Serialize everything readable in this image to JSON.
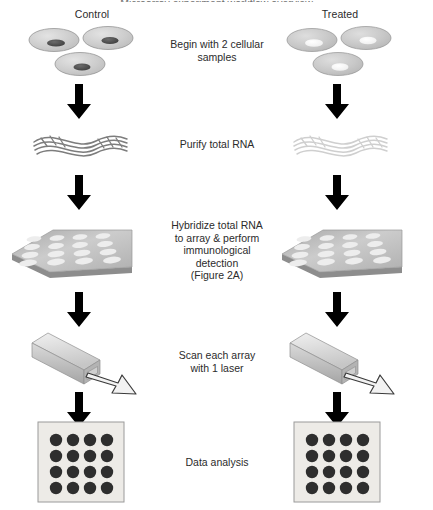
{
  "figure": {
    "title_clipped": "Microarray experiment workflow overview",
    "columns": [
      {
        "id": "control",
        "label": "Control"
      },
      {
        "id": "treated",
        "label": "Treated"
      }
    ],
    "steps": [
      {
        "id": "cells",
        "caption": "Begin with 2 cellular\nsamples",
        "caption_lines": [
          "Begin with 2 cellular",
          "samples"
        ],
        "icon_left": "cells-dark-nuclei-icon",
        "icon_right": "cells-light-nuclei-icon"
      },
      {
        "id": "rna",
        "caption": "Purify total RNA",
        "caption_lines": [
          "Purify total RNA"
        ],
        "icon_left": "rna-strands-dark-icon",
        "icon_right": "rna-strands-light-icon"
      },
      {
        "id": "hybridize",
        "caption": "Hybridize total RNA to array & perform immunological detection (Figure 2A)",
        "caption_lines": [
          "Hybridize total RNA",
          "to array & perform",
          "immunological",
          "detection",
          "(Figure 2A)"
        ],
        "icon_left": "microarray-slide-icon",
        "icon_right": "microarray-slide-icon"
      },
      {
        "id": "scan",
        "caption": "Scan each array with 1 laser",
        "caption_lines": [
          "Scan each array",
          "with 1 laser"
        ],
        "icon_left": "laser-scanner-icon",
        "icon_right": "laser-scanner-icon"
      },
      {
        "id": "analysis",
        "caption": "Data analysis",
        "caption_lines": [
          "Data analysis"
        ],
        "icon_left": "spot-grid-result-icon",
        "icon_right": "spot-grid-result-icon"
      }
    ],
    "arrows": {
      "name": "down-arrow-icon",
      "count_per_column": 4,
      "color": "#000000"
    },
    "array_grid": {
      "rows": 4,
      "cols": 4,
      "spots": 16
    },
    "result_grid": {
      "rows": 4,
      "cols": 4,
      "spots": 16
    },
    "cell_count_per_sample": 3,
    "colors": {
      "text": "#2b2b2b",
      "arrow": "#000000",
      "cell_fill": "#c9c9c9",
      "cell_outline": "#8f8f8f",
      "nucleus_control": "#4a4a4a",
      "nucleus_treated": "#f2f2f2",
      "rna_control": "#7d7d7d",
      "rna_treated": "#cfcfcf",
      "slide_top": "#b8b8b8",
      "slide_edge": "#9a9a9a",
      "slide_spot": "#ececec",
      "laser_body": "#d0d0d0",
      "laser_top": "#e8e8e8",
      "laser_side": "#a8a8a8",
      "beam_outline": "#3a3a3a",
      "result_panel": "#eceae6",
      "result_border": "#9a9a9a",
      "result_spot": "#2e2e2e"
    }
  }
}
